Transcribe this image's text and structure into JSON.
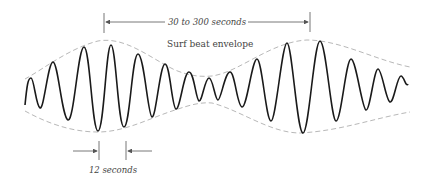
{
  "diagram": {
    "type": "surf-beat-wave-group",
    "labels": {
      "beat_period": "30 to 300 seconds",
      "envelope": "Surf beat envelope",
      "wave_period": "12 seconds"
    },
    "colors": {
      "wave": "#1a1a1a",
      "envelope": "#b0b0b0",
      "dimension": "#555555",
      "background": "#ffffff"
    },
    "geometry": {
      "center_y": 95,
      "x_start": 25,
      "x_end": 410,
      "envelope_peaks_x": [
        98,
        307
      ],
      "envelope_node_x": 205
    }
  }
}
